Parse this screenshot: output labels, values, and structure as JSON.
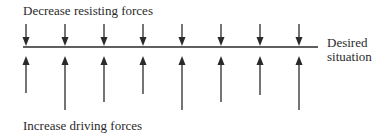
{
  "labels": {
    "top": "Decrease resisting forces",
    "bottom": "Increase driving forces",
    "desired_line1": "Desired",
    "desired_line2": "situation"
  },
  "diagram": {
    "baseline": {
      "x1": 23,
      "x2": 318,
      "y": 47,
      "color": "#2a2a2a"
    },
    "resisting_forces": [
      {
        "x": 26,
        "y_start": 24,
        "y_tip": 46
      },
      {
        "x": 65,
        "y_start": 24,
        "y_tip": 46
      },
      {
        "x": 104,
        "y_start": 24,
        "y_tip": 46
      },
      {
        "x": 143,
        "y_start": 24,
        "y_tip": 46
      },
      {
        "x": 182,
        "y_start": 24,
        "y_tip": 46
      },
      {
        "x": 221,
        "y_start": 24,
        "y_tip": 46
      },
      {
        "x": 260,
        "y_start": 24,
        "y_tip": 46
      },
      {
        "x": 299,
        "y_start": 24,
        "y_tip": 46
      }
    ],
    "driving_forces": [
      {
        "x": 26,
        "y_start": 93,
        "y_tip": 56
      },
      {
        "x": 65,
        "y_start": 110,
        "y_tip": 56
      },
      {
        "x": 104,
        "y_start": 102,
        "y_tip": 56
      },
      {
        "x": 143,
        "y_start": 94,
        "y_tip": 56
      },
      {
        "x": 182,
        "y_start": 110,
        "y_tip": 56
      },
      {
        "x": 221,
        "y_start": 102,
        "y_tip": 56
      },
      {
        "x": 260,
        "y_start": 95,
        "y_tip": 56
      },
      {
        "x": 299,
        "y_start": 110,
        "y_tip": 56
      }
    ]
  }
}
